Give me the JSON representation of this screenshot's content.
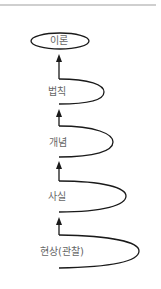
{
  "diagram": {
    "type": "hierarchy-ladder",
    "direction": "bottom-to-top",
    "top_node": {
      "label": "이론",
      "shape": "ellipse"
    },
    "steps": [
      {
        "label": "법칙"
      },
      {
        "label": "개념"
      },
      {
        "label": "사실"
      },
      {
        "label": "현상(관찰)"
      }
    ],
    "colors": {
      "line": "#1a1a1a",
      "text": "#666666",
      "rule": "#cfcfcf"
    }
  }
}
